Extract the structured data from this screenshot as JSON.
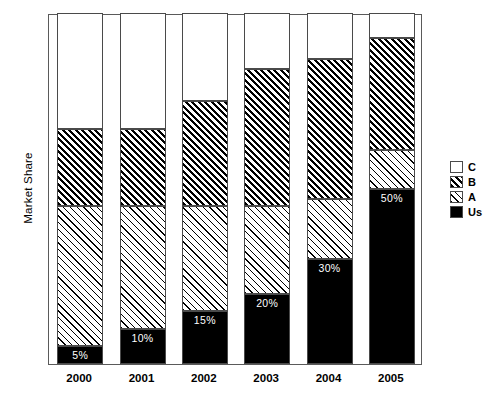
{
  "chart_data": {
    "type": "bar",
    "subtype": "stacked-100-percent",
    "title": "",
    "xlabel": "",
    "ylabel": "Market Share",
    "ylim": [
      0,
      100
    ],
    "grid": false,
    "legend_position": "right",
    "categories": [
      "2000",
      "2001",
      "2002",
      "2003",
      "2004",
      "2005"
    ],
    "series": [
      {
        "name": "Us",
        "pattern": "solid-black",
        "values": [
          5,
          10,
          15,
          20,
          30,
          50
        ]
      },
      {
        "name": "A",
        "pattern": "sparse-diagonal-hatch",
        "values": [
          40,
          35,
          30,
          25,
          17,
          11
        ]
      },
      {
        "name": "B",
        "pattern": "dense-diagonal-hatch",
        "values": [
          22,
          22,
          30,
          39,
          40,
          32
        ]
      },
      {
        "name": "C",
        "pattern": "white-empty",
        "values": [
          33,
          33,
          25,
          16,
          13,
          7
        ]
      }
    ],
    "stack_order_bottom_to_top": [
      "Us",
      "A",
      "B",
      "C"
    ],
    "cumulative_tops": {
      "Us": [
        5,
        10,
        15,
        20,
        30,
        50
      ],
      "A": [
        45,
        45,
        45,
        45,
        47,
        61
      ],
      "B": [
        67,
        67,
        75,
        84,
        87,
        93
      ],
      "C": [
        100,
        100,
        100,
        100,
        100,
        100
      ]
    },
    "data_labels": [
      {
        "category": "2000",
        "series": "Us",
        "text": "5%",
        "value": 5
      },
      {
        "category": "2001",
        "series": "Us",
        "text": "10%",
        "value": 10
      },
      {
        "category": "2002",
        "series": "Us",
        "text": "15%",
        "value": 15
      },
      {
        "category": "2003",
        "series": "Us",
        "text": "20%",
        "value": 20
      },
      {
        "category": "2004",
        "series": "Us",
        "text": "30%",
        "value": 30
      },
      {
        "category": "2005",
        "series": "Us",
        "text": "50%",
        "value": 50
      }
    ]
  },
  "axis": {
    "y_title": "Market Share",
    "x_ticks": [
      "2000",
      "2001",
      "2002",
      "2003",
      "2004",
      "2005"
    ]
  },
  "legend": {
    "items": [
      {
        "label": "C",
        "pattern": "white-empty"
      },
      {
        "label": "B",
        "pattern": "dense-diagonal-hatch"
      },
      {
        "label": "A",
        "pattern": "sparse-diagonal-hatch"
      },
      {
        "label": "Us",
        "pattern": "solid-black"
      }
    ]
  },
  "colors": {
    "ink": "#000000",
    "frame": "#5a5a5a",
    "background": "#ffffff",
    "label_text": "#ffffff"
  }
}
